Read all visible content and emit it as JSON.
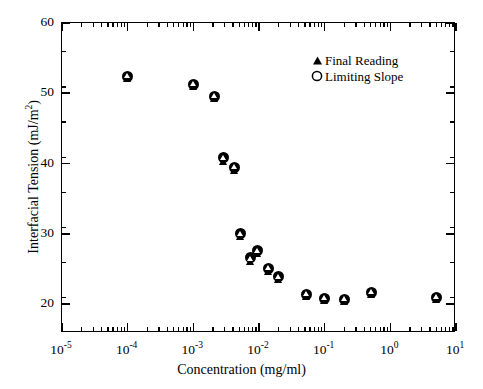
{
  "chart_data": {
    "type": "scatter",
    "title": "",
    "xlabel": "Concentration (mg/ml)",
    "ylabel": "Interfacial Tension (mJ/m²)",
    "ylabel_html": "Interfacial Tension (mJ/m",
    "ylabel_sup": "2",
    "ylabel_tail": ")",
    "xscale": "log",
    "yscale": "linear",
    "xlim": [
      1e-05,
      10
    ],
    "ylim": [
      15.9,
      60
    ],
    "grid": false,
    "legend_position": "top-right",
    "xticks": [
      {
        "value": 1e-05,
        "label_base": "10",
        "label_exp": "-5"
      },
      {
        "value": 0.0001,
        "label_base": "10",
        "label_exp": "-4"
      },
      {
        "value": 0.001,
        "label_base": "10",
        "label_exp": "-3"
      },
      {
        "value": 0.01,
        "label_base": "10",
        "label_exp": "-2"
      },
      {
        "value": 0.1,
        "label_base": "10",
        "label_exp": "-1"
      },
      {
        "value": 1,
        "label_base": "10",
        "label_exp": "0"
      },
      {
        "value": 10,
        "label_base": "10",
        "label_exp": "1"
      }
    ],
    "yticks": [
      {
        "value": 20,
        "label": "20"
      },
      {
        "value": 30,
        "label": "30"
      },
      {
        "value": 40,
        "label": "40"
      },
      {
        "value": 50,
        "label": "50"
      },
      {
        "value": 60,
        "label": "60"
      }
    ],
    "yminor_step": 5,
    "series": [
      {
        "name": "Final Reading",
        "marker": "filled-triangle",
        "color": "#000000",
        "points": [
          {
            "x": 0.0001,
            "y": 52.2
          },
          {
            "x": 0.001,
            "y": 51.1
          },
          {
            "x": 0.0021,
            "y": 49.4
          },
          {
            "x": 0.0029,
            "y": 40.5
          },
          {
            "x": 0.0042,
            "y": 39.2
          },
          {
            "x": 0.0052,
            "y": 29.7
          },
          {
            "x": 0.0073,
            "y": 26.2
          },
          {
            "x": 0.0096,
            "y": 27.3
          },
          {
            "x": 0.014,
            "y": 24.8
          },
          {
            "x": 0.02,
            "y": 23.6
          },
          {
            "x": 0.052,
            "y": 21.2
          },
          {
            "x": 0.1,
            "y": 20.6
          },
          {
            "x": 0.2,
            "y": 20.5
          },
          {
            "x": 0.52,
            "y": 21.5
          },
          {
            "x": 5.0,
            "y": 20.8
          }
        ]
      },
      {
        "name": "Limiting Slope",
        "marker": "open-circle",
        "color": "#000000",
        "points": [
          {
            "x": 0.0001,
            "y": 52.4
          },
          {
            "x": 0.001,
            "y": 51.3
          },
          {
            "x": 0.0021,
            "y": 49.6
          },
          {
            "x": 0.0029,
            "y": 40.8
          },
          {
            "x": 0.0042,
            "y": 39.4
          },
          {
            "x": 0.0052,
            "y": 30.1
          },
          {
            "x": 0.0073,
            "y": 26.6
          },
          {
            "x": 0.0096,
            "y": 27.6
          },
          {
            "x": 0.014,
            "y": 25.1
          },
          {
            "x": 0.02,
            "y": 23.9
          },
          {
            "x": 0.052,
            "y": 21.4
          },
          {
            "x": 0.1,
            "y": 20.8
          },
          {
            "x": 0.2,
            "y": 20.7
          },
          {
            "x": 0.52,
            "y": 21.7
          },
          {
            "x": 5.0,
            "y": 21.0
          }
        ]
      }
    ]
  },
  "legend": {
    "entries": [
      {
        "label": "Final Reading",
        "marker": "triangle-icon"
      },
      {
        "label": "Limiting Slope",
        "marker": "circle-icon"
      }
    ]
  }
}
